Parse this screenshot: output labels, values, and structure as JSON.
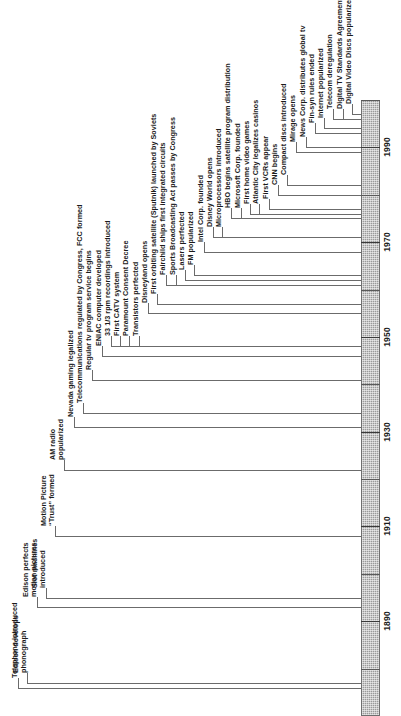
{
  "figure": {
    "orientation": "vertical-rotated",
    "axis_label": "",
    "line_color": "#6b6b6b",
    "bar_color": "#9a9a9a",
    "text_color": "#1b1b1b"
  },
  "axis": {
    "years": [
      "1890",
      "1910",
      "1930",
      "1950",
      "1970",
      "1990"
    ],
    "range_start": 1870,
    "range_end": 2000,
    "minor_tick_interval": 10,
    "major_tick_interval": 20
  },
  "chart_data": {
    "type": "table",
    "xlabel": "",
    "ylabel": "Year",
    "xlim": [
      1870,
      2000
    ],
    "grid": false,
    "legend": "none",
    "categories": [
      "Telephone introduced",
      "Edison develops phonograph",
      "Edison perfects motion pictures",
      "Slot machines introduced",
      "Motion Picture \"Trust\" formed",
      "AM radio popularized",
      "Nevada gaming legalized",
      "Telecommunications regulated by Congress, FCC formed",
      "Regular tv program service begins",
      "ENIAC computer developed",
      "33 1/3 rpm recordings introduced",
      "First CATV system",
      "Paramount Consent Decree",
      "Transistors perfected",
      "Disneyland opens",
      "First orbiting satellite (Sputnik) launched by Soviets",
      "Fairchild ships first integrated circuits",
      "Sports Broadcasting Act passes by Congress",
      "Lasers perfected",
      "FM popularized",
      "Intel Corp. founded",
      "Disney World opens",
      "Microprocessors introduced",
      "HBO begins satellite program distribution",
      "Microsoft Corp. founded",
      "First home video games",
      "Atlantic City legalizes casinos",
      "First VCRs appear",
      "CNN begins",
      "Compact discs introduced",
      "Mirage opens",
      "News Corp. distributes global tv",
      "Fin-syn rules ended",
      "Internet popularized",
      "Telecom deregulation",
      "Digital TV Standards Agreement",
      "Digital Video Discs popularized"
    ],
    "values": [
      1876,
      1877,
      1893,
      1895,
      1908,
      1922,
      1931,
      1934,
      1941,
      1946,
      1948,
      1948,
      1948,
      1948,
      1955,
      1957,
      1961,
      1961,
      1962,
      1963,
      1968,
      1971,
      1971,
      1975,
      1975,
      1976,
      1976,
      1977,
      1980,
      1982,
      1989,
      1990,
      1993,
      1994,
      1996,
      1996,
      1997
    ]
  },
  "events": [
    {
      "label": "Telephone introduced",
      "year": 1876,
      "lines": [
        "Telephone introduced"
      ]
    },
    {
      "label": "Edison develops phonograph",
      "year": 1877,
      "lines": [
        "Edison develops",
        "phonograph"
      ]
    },
    {
      "label": "Edison perfects motion pictures",
      "year": 1893,
      "lines": [
        "Edison perfects",
        "motion pictures"
      ]
    },
    {
      "label": "Slot machines introduced",
      "year": 1895,
      "lines": [
        "Slot machines",
        "introduced"
      ]
    },
    {
      "label": "Motion Picture \"Trust\" formed",
      "year": 1908,
      "lines": [
        "Motion Picture",
        "“Trust” formed"
      ]
    },
    {
      "label": "AM radio popularized",
      "year": 1922,
      "lines": [
        "AM radio",
        "popularized"
      ]
    },
    {
      "label": "Nevada gaming legalized",
      "year": 1931,
      "lines": [
        "Nevada gaming legalized"
      ]
    },
    {
      "label": "Telecommunications regulated by Congress, FCC formed",
      "year": 1934,
      "lines": [
        "Telecommunications regulated by Congress, FCC formed"
      ]
    },
    {
      "label": "Regular tv program service begins",
      "year": 1941,
      "lines": [
        "Regular tv program service begins"
      ]
    },
    {
      "label": "ENIAC computer developed",
      "year": 1946,
      "lines": [
        "ENIAC computer developed"
      ]
    },
    {
      "label": "33 1/3 rpm recordings introduced",
      "year": 1948,
      "lines": [
        "33 1/3 rpm recordings introduced"
      ]
    },
    {
      "label": "First CATV system",
      "year": 1948,
      "lines": [
        "First CATV system"
      ]
    },
    {
      "label": "Paramount Consent Decree",
      "year": 1948,
      "lines": [
        "Paramount Consent Decree"
      ]
    },
    {
      "label": "Transistors perfected",
      "year": 1948,
      "lines": [
        "Transistors perfected"
      ]
    },
    {
      "label": "Disneyland opens",
      "year": 1955,
      "lines": [
        "Disneyland opens"
      ]
    },
    {
      "label": "First orbiting satellite (Sputnik) launched by Soviets",
      "year": 1957,
      "lines": [
        "First orbiting satellite (Sputnik) launched by Soviets"
      ]
    },
    {
      "label": "Fairchild ships first integrated circuits",
      "year": 1961,
      "lines": [
        "Fairchild ships first integrated circuits"
      ]
    },
    {
      "label": "Sports Broadcasting Act passes by Congress",
      "year": 1961,
      "lines": [
        "Sports Broadcasting Act passes by Congress"
      ]
    },
    {
      "label": "Lasers perfected",
      "year": 1962,
      "lines": [
        "Lasers perfected"
      ]
    },
    {
      "label": "FM popularized",
      "year": 1963,
      "lines": [
        "FM popularized"
      ]
    },
    {
      "label": "Intel Corp. founded",
      "year": 1968,
      "lines": [
        "Intel Corp. founded"
      ]
    },
    {
      "label": "Disney World opens",
      "year": 1971,
      "lines": [
        "Disney World opens"
      ]
    },
    {
      "label": "Microprocessors introduced",
      "year": 1971,
      "lines": [
        "Microprocessors introduced"
      ]
    },
    {
      "label": "HBO begins satellite program distribution",
      "year": 1975,
      "lines": [
        "HBO begins satellite program distribution"
      ]
    },
    {
      "label": "Microsoft Corp. founded",
      "year": 1975,
      "lines": [
        "Microsoft Corp. founded"
      ]
    },
    {
      "label": "First home video games",
      "year": 1976,
      "lines": [
        "First home video games"
      ]
    },
    {
      "label": "Atlantic City legalizes casinos",
      "year": 1976,
      "lines": [
        "Atlantic City legalizes casinos"
      ]
    },
    {
      "label": "First VCRs appear",
      "year": 1977,
      "lines": [
        "First VCRs appear"
      ]
    },
    {
      "label": "CNN begins",
      "year": 1980,
      "lines": [
        "CNN begins"
      ]
    },
    {
      "label": "Compact discs introduced",
      "year": 1982,
      "lines": [
        "Compact discs introduced"
      ]
    },
    {
      "label": "Mirage opens",
      "year": 1989,
      "lines": [
        "Mirage opens"
      ]
    },
    {
      "label": "News Corp. distributes global tv",
      "year": 1990,
      "lines": [
        "News Corp. distributes global tv"
      ]
    },
    {
      "label": "Fin-syn rules ended",
      "year": 1993,
      "lines": [
        "Fin-syn rules ended"
      ]
    },
    {
      "label": "Internet popularized",
      "year": 1994,
      "lines": [
        "Internet popularized"
      ]
    },
    {
      "label": "Telecom deregulation",
      "year": 1996,
      "lines": [
        "Telecom deregulation"
      ]
    },
    {
      "label": "Digital TV Standards Agreement",
      "year": 1996,
      "lines": [
        "Digital TV Standards Agreement"
      ]
    },
    {
      "label": "Digital Video Discs popularized",
      "year": 1997,
      "lines": [
        "Digital Video Discs popularized"
      ]
    }
  ]
}
